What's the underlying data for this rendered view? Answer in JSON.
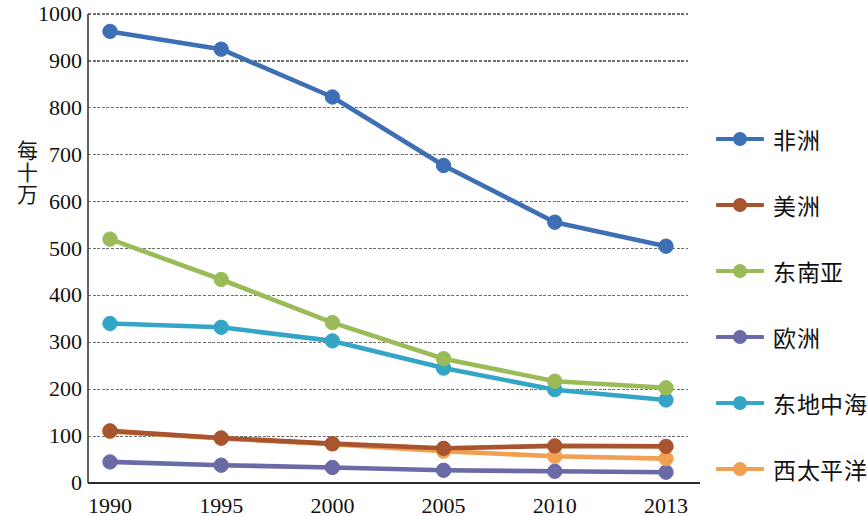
{
  "chart_data": {
    "type": "line",
    "title": "",
    "xlabel": "",
    "ylabel": "每十万",
    "categories": [
      "1990",
      "1995",
      "2000",
      "2005",
      "2010",
      "2013"
    ],
    "ylim": [
      0,
      1000
    ],
    "ytick_values": [
      0,
      100,
      200,
      300,
      400,
      500,
      600,
      700,
      800,
      900,
      1000
    ],
    "ytick_labels": [
      "0",
      "100",
      "200",
      "300",
      "400",
      "500",
      "600",
      "700",
      "800",
      "900",
      "1000"
    ],
    "grid": true,
    "legend_position": "right",
    "series": [
      {
        "name": "非洲",
        "color": "#3C6FB4",
        "values": [
          963,
          925,
          823,
          677,
          556,
          505
        ]
      },
      {
        "name": "美洲",
        "color": "#A8542F",
        "values": [
          111,
          96,
          84,
          74,
          79,
          78
        ]
      },
      {
        "name": "东南亚",
        "color": "#9BBB59",
        "values": [
          520,
          434,
          342,
          265,
          217,
          203
        ]
      },
      {
        "name": "欧洲",
        "color": "#6A6AA6",
        "values": [
          45,
          38,
          33,
          27,
          25,
          23
        ]
      },
      {
        "name": "东地中海",
        "color": "#34A5C6",
        "values": [
          340,
          332,
          303,
          245,
          199,
          177
        ]
      },
      {
        "name": "西太平洋",
        "color": "#F0A050",
        "values": [
          110,
          95,
          83,
          68,
          57,
          52
        ]
      }
    ]
  },
  "axis": {
    "y_label_text": "每十万"
  }
}
